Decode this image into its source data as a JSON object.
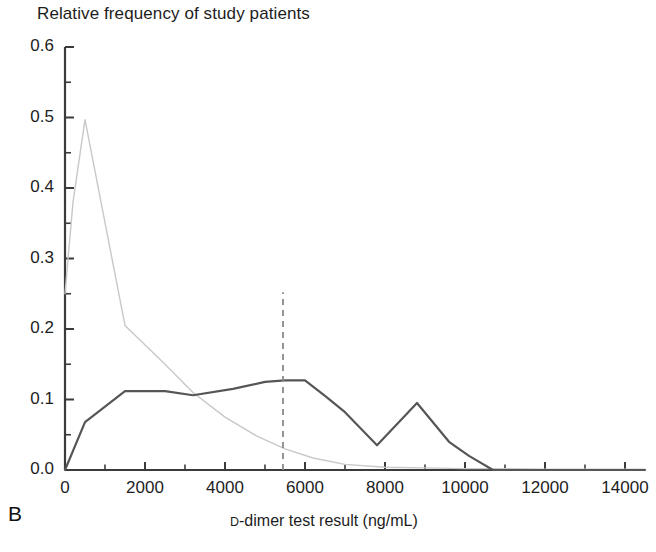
{
  "figure": {
    "panel_label": "B",
    "title": "Relative frequency of study patients",
    "xlabel_prefix": "D",
    "xlabel_rest": "-dimer test result (ng/mL)"
  },
  "chart_data": {
    "type": "line",
    "title": "Relative frequency of study patients",
    "xlabel": "D-dimer test result (ng/mL)",
    "ylabel": "Relative frequency of study patients",
    "xlim": [
      0,
      14500
    ],
    "ylim": [
      0.0,
      0.6
    ],
    "grid": false,
    "legend": "none",
    "xticks": [
      0,
      2000,
      4000,
      6000,
      8000,
      10000,
      12000,
      14000
    ],
    "xtick_labels": [
      "0",
      "2000",
      "4000",
      "6000",
      "8000",
      "10000",
      "12000",
      "14000"
    ],
    "xminor_step": 1000,
    "yticks": [
      0.0,
      0.1,
      0.2,
      0.3,
      0.4,
      0.5,
      0.6
    ],
    "ytick_labels": [
      "0.0",
      "0.1",
      "0.2",
      "0.3",
      "0.4",
      "0.5",
      "0.6"
    ],
    "yminor_step": 0.05,
    "series": [
      {
        "name": "no-pulmonary-embolism",
        "color": "#c8c8c8",
        "width": 1.4,
        "style": "solid",
        "x": [
          0,
          200,
          500,
          1500,
          2500,
          3200,
          4000,
          4800,
          5500,
          6200,
          7000,
          8000,
          9000,
          10000,
          10700,
          12000,
          14500
        ],
        "y": [
          0.25,
          0.38,
          0.497,
          0.205,
          0.15,
          0.11,
          0.075,
          0.048,
          0.03,
          0.017,
          0.008,
          0.004,
          0.003,
          0.002,
          0.002,
          0.001,
          0.001
        ]
      },
      {
        "name": "pulmonary-embolism",
        "color": "#565656",
        "width": 2.2,
        "style": "solid",
        "x": [
          0,
          500,
          1500,
          2500,
          3200,
          4200,
          5000,
          5500,
          6000,
          6500,
          7000,
          7800,
          8800,
          9600,
          10100,
          10700,
          14500
        ],
        "y": [
          0.0,
          0.068,
          0.112,
          0.112,
          0.106,
          0.115,
          0.125,
          0.127,
          0.127,
          0.105,
          0.082,
          0.035,
          0.095,
          0.04,
          0.02,
          0.0,
          0.0
        ]
      }
    ],
    "annotations": [
      {
        "name": "cutoff-line",
        "type": "vline",
        "x": 5450,
        "y_from": 0.0,
        "y_to": 0.252,
        "style": "dashed",
        "color": "#8a8a8a"
      }
    ]
  }
}
